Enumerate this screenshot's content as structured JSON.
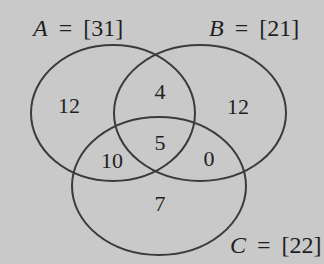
{
  "diagram": {
    "type": "venn-3-set",
    "colors": {
      "background": "#c9c9c9",
      "stroke": "#3b3b3b",
      "text": "#1f1f1f"
    },
    "sets": [
      {
        "id": "A",
        "var": "A",
        "equals": "=",
        "total": "[31]",
        "cx": 113,
        "cy": 113,
        "rx": 82,
        "ry": 68,
        "label_x": 33,
        "label_y": 36
      },
      {
        "id": "B",
        "var": "B",
        "equals": "=",
        "total": "[21]",
        "cx": 200,
        "cy": 113,
        "rx": 86,
        "ry": 68,
        "label_x": 209,
        "label_y": 36
      },
      {
        "id": "C",
        "var": "C",
        "equals": "=",
        "total": "[22]",
        "cx": 159,
        "cy": 186,
        "rx": 87,
        "ry": 69,
        "label_x": 230,
        "label_y": 253
      }
    ],
    "regions": [
      {
        "id": "A-only",
        "value": "12",
        "x": 69,
        "y": 113
      },
      {
        "id": "A-and-B-only",
        "value": "4",
        "x": 160,
        "y": 99
      },
      {
        "id": "B-only",
        "value": "12",
        "x": 238,
        "y": 114
      },
      {
        "id": "A-and-C-only",
        "value": "10",
        "x": 112,
        "y": 168
      },
      {
        "id": "A-and-B-and-C",
        "value": "5",
        "x": 160,
        "y": 150
      },
      {
        "id": "B-and-C-only",
        "value": "0",
        "x": 209,
        "y": 166
      },
      {
        "id": "C-only",
        "value": "7",
        "x": 160,
        "y": 211
      }
    ]
  }
}
